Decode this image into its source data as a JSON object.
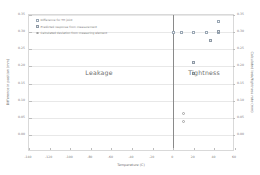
{
  "chart_data": {
    "type": "scatter",
    "title": "",
    "xlabel": "Temperature (C)",
    "ylabel_left": "Difference in position (mm)",
    "ylabel_right": "Calculated leak/tightness rate (mm)",
    "xlim": [
      -140,
      60
    ],
    "ylim_left": [
      -0.05,
      0.35
    ],
    "ylim_right": [
      -0.05,
      0.35
    ],
    "grid": true,
    "legend_position": "upper-left",
    "xticks": [
      -140,
      -120,
      -100,
      -80,
      -60,
      -40,
      -20,
      0,
      20,
      40,
      60
    ],
    "xticklabels": [
      "-140",
      "-120",
      "-100",
      "-80",
      "-60",
      "-40",
      "-20",
      "0",
      "20",
      "40",
      "60"
    ],
    "yticks_left": [
      0.0,
      0.05,
      0.1,
      0.15,
      0.2,
      0.25,
      0.3,
      0.35
    ],
    "yticklabels_left": [
      "0.00",
      "0.05",
      "0.10",
      "0.15",
      "0.20",
      "0.25",
      "0.30",
      "0.35"
    ],
    "yticks_right": [
      0.0,
      0.05,
      0.1,
      0.15,
      0.2,
      0.25,
      0.3,
      0.35
    ],
    "yticklabels_right": [
      "0.00",
      "0.05",
      "0.10",
      "0.15",
      "0.20",
      "0.25",
      "0.30",
      "0.35"
    ],
    "reference_line_x": 0,
    "annotations": [
      {
        "text": "Leakage",
        "x": -72,
        "y": 0.185
      },
      {
        "text": "Tightness",
        "x": 30,
        "y": 0.185
      }
    ],
    "series": [
      {
        "name": "Difference for TH joint",
        "marker": "m0",
        "points": [
          {
            "x": 0,
            "y": 0.3
          },
          {
            "x": 8,
            "y": 0.3
          },
          {
            "x": 20,
            "y": 0.3
          },
          {
            "x": 32,
            "y": 0.3
          },
          {
            "x": 44,
            "y": 0.3
          },
          {
            "x": 44,
            "y": 0.33
          }
        ]
      },
      {
        "name": "Predicted response from measurement",
        "marker": "m1",
        "points": [
          {
            "x": 36,
            "y": 0.275
          },
          {
            "x": 44,
            "y": 0.302
          },
          {
            "x": 20,
            "y": 0.21
          },
          {
            "x": 20,
            "y": 0.178
          }
        ]
      },
      {
        "name": "Calculated deviation from measuring element",
        "marker": "m2",
        "points": [
          {
            "x": 10,
            "y": 0.063
          },
          {
            "x": 10,
            "y": 0.04
          }
        ]
      }
    ]
  }
}
